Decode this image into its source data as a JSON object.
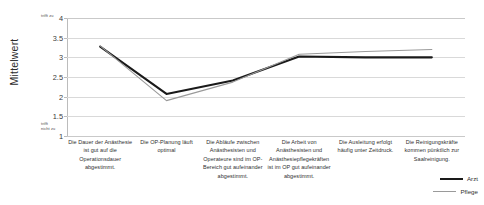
{
  "chart_data": {
    "type": "line",
    "title": "",
    "xlabel": "",
    "ylabel": "Mittelwert",
    "ylim": [
      1,
      4
    ],
    "yticks": [
      "1",
      "1.5",
      "2",
      "2.5",
      "3",
      "3.5",
      "4"
    ],
    "grid": true,
    "legend_position": "bottom-right",
    "scale_anchor_high": "trifft zu",
    "scale_anchor_low": "trifft nicht zu",
    "categories": [
      "Die Dauer der Anästhesie ist gut auf die Operationsdauer abgestimmt.",
      "Die OP-Planung läuft optimal",
      "Die Abläufe zwischen Anästhesisten und Operateure sind im OP-Bereich gut aufeinander abgestimmt.",
      "Die Arbeit von Anästhesisten und Anästhesiepflegekräften ist im OP gut aufeinander abgestimmt.",
      "Die Ausleitung erfolgt häufig unter Zeitdruck.",
      "Die Reinigungskräfte kommen pünktlich zur Saalreinigung."
    ],
    "series": [
      {
        "name": "Arzt",
        "color": "#1a1a1a",
        "values": [
          3.27,
          2.07,
          2.41,
          3.02,
          3.0,
          3.0
        ]
      },
      {
        "name": "Pflege",
        "color": "#9a9a9a",
        "values": [
          3.29,
          1.9,
          2.37,
          3.08,
          3.15,
          3.2
        ]
      }
    ]
  },
  "axis": {
    "y_title": "Mittelwert",
    "anchor_top": "trifft zu",
    "anchor_bottom_line1": "trifft",
    "anchor_bottom_line2": "nicht zu"
  },
  "legend": {
    "items": [
      {
        "label": "Arzt"
      },
      {
        "label": "Pflege"
      }
    ]
  }
}
